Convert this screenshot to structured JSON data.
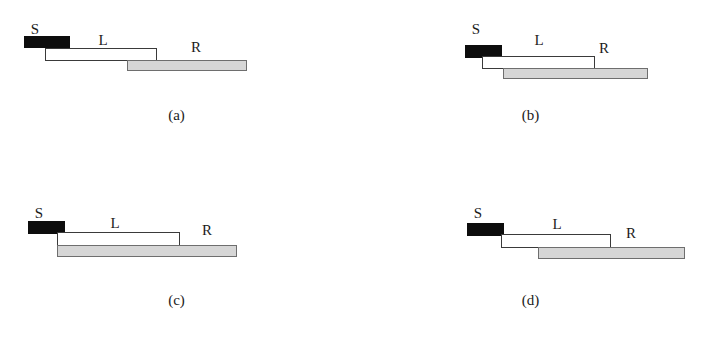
{
  "figure": {
    "width": 707,
    "height": 343,
    "background_color": "#ffffff",
    "colors": {
      "s_bar_fill": "#0d0d0d",
      "l_bar_fill": "#ffffff",
      "l_bar_stroke": "#3a3a3a",
      "r_bar_fill": "#d6d6d6",
      "r_bar_stroke": "#6e6e6e",
      "text": "#1b1b1b"
    }
  },
  "panels": [
    {
      "id": "panel-a",
      "caption": "(a)",
      "origin": {
        "x": 0,
        "y": 0
      },
      "caption_y": 108,
      "segments": [
        {
          "name": "S",
          "style": "solid",
          "label": "S",
          "label_x": 35,
          "label_y": 22,
          "x": 24,
          "y": 36,
          "width": 46,
          "height": 12
        },
        {
          "name": "L",
          "style": "outline",
          "label": "L",
          "label_x": 103,
          "label_y": 33,
          "x": 45,
          "y": 48,
          "width": 112,
          "height": 13
        },
        {
          "name": "R",
          "style": "filled",
          "label": "R",
          "label_x": 196,
          "label_y": 40,
          "x": 127,
          "y": 60,
          "width": 120,
          "height": 11
        }
      ]
    },
    {
      "id": "panel-b",
      "caption": "(b)",
      "origin": {
        "x": 354,
        "y": 0
      },
      "caption_y": 108,
      "segments": [
        {
          "name": "S",
          "style": "solid",
          "label": "S",
          "label_x": 122,
          "label_y": 22,
          "x": 111,
          "y": 45,
          "width": 37,
          "height": 13
        },
        {
          "name": "L",
          "style": "outline",
          "label": "L",
          "label_x": 185,
          "label_y": 33,
          "x": 128,
          "y": 56,
          "width": 113,
          "height": 13
        },
        {
          "name": "R",
          "style": "filled",
          "label": "R",
          "label_x": 250,
          "label_y": 41,
          "x": 149,
          "y": 68,
          "width": 145,
          "height": 11
        }
      ]
    },
    {
      "id": "panel-c",
      "caption": "(c)",
      "origin": {
        "x": 0,
        "y": 185
      },
      "caption_y": 108,
      "segments": [
        {
          "name": "S",
          "style": "solid",
          "label": "S",
          "label_x": 39,
          "label_y": 21,
          "x": 28,
          "y": 36,
          "width": 37,
          "height": 13
        },
        {
          "name": "L",
          "style": "outline",
          "label": "L",
          "label_x": 115,
          "label_y": 31,
          "x": 57,
          "y": 47,
          "width": 123,
          "height": 14
        },
        {
          "name": "R",
          "style": "filled",
          "label": "R",
          "label_x": 207,
          "label_y": 38,
          "x": 57,
          "y": 60,
          "width": 180,
          "height": 12
        }
      ]
    },
    {
      "id": "panel-d",
      "caption": "(d)",
      "origin": {
        "x": 354,
        "y": 185
      },
      "caption_y": 108,
      "segments": [
        {
          "name": "S",
          "style": "solid",
          "label": "S",
          "label_x": 124,
          "label_y": 21,
          "x": 113,
          "y": 38,
          "width": 37,
          "height": 13
        },
        {
          "name": "L",
          "style": "outline",
          "label": "L",
          "label_x": 203,
          "label_y": 32,
          "x": 147,
          "y": 49,
          "width": 110,
          "height": 14
        },
        {
          "name": "R",
          "style": "filled",
          "label": "R",
          "label_x": 277,
          "label_y": 41,
          "x": 184,
          "y": 62,
          "width": 147,
          "height": 12
        }
      ]
    }
  ]
}
